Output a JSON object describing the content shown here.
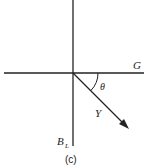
{
  "diagram": {
    "labels": {
      "horizontal_axis": "G",
      "vertical_axis": "B",
      "vertical_axis_sub": "L",
      "angle": "θ",
      "vector": "Y",
      "caption": "(c)"
    },
    "colors": {
      "line": "#222222",
      "background": "#ffffff"
    }
  }
}
